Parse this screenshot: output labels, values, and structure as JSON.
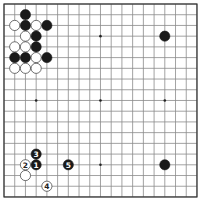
{
  "board": {
    "size": 19,
    "origin_x": 4,
    "origin_y": 4,
    "spacing": 10.72,
    "stone_radius": 5.1,
    "colors": {
      "black": "#1a1a1a",
      "white": "#ffffff",
      "grid": "#8a8a8a",
      "border": "#333333"
    },
    "hoshi": [
      [
        3,
        3
      ],
      [
        9,
        3
      ],
      [
        15,
        3
      ],
      [
        3,
        9
      ],
      [
        9,
        9
      ],
      [
        15,
        9
      ],
      [
        3,
        15
      ],
      [
        9,
        15
      ],
      [
        15,
        15
      ]
    ],
    "stones": [
      {
        "color": "black",
        "col": 2,
        "row": 1
      },
      {
        "color": "white",
        "col": 1,
        "row": 2
      },
      {
        "color": "black",
        "col": 2,
        "row": 2
      },
      {
        "color": "white",
        "col": 3,
        "row": 2
      },
      {
        "color": "black",
        "col": 4,
        "row": 2
      },
      {
        "color": "white",
        "col": 2,
        "row": 3
      },
      {
        "color": "black",
        "col": 3,
        "row": 3
      },
      {
        "color": "white",
        "col": 1,
        "row": 4
      },
      {
        "color": "white",
        "col": 2,
        "row": 4
      },
      {
        "color": "black",
        "col": 3,
        "row": 4
      },
      {
        "color": "black",
        "col": 1,
        "row": 5
      },
      {
        "color": "black",
        "col": 2,
        "row": 5
      },
      {
        "color": "white",
        "col": 3,
        "row": 5
      },
      {
        "color": "black",
        "col": 4,
        "row": 5
      },
      {
        "color": "white",
        "col": 1,
        "row": 6
      },
      {
        "color": "white",
        "col": 2,
        "row": 6
      },
      {
        "color": "white",
        "col": 3,
        "row": 6
      },
      {
        "color": "black",
        "col": 15,
        "row": 3
      },
      {
        "color": "black",
        "col": 15,
        "row": 15
      },
      {
        "color": "white",
        "col": 2,
        "row": 16
      },
      {
        "color": "black",
        "col": 3,
        "row": 15,
        "label": "1"
      },
      {
        "color": "white",
        "col": 2,
        "row": 15,
        "label": "2"
      },
      {
        "color": "black",
        "col": 3,
        "row": 14,
        "label": "3"
      },
      {
        "color": "white",
        "col": 4,
        "row": 17,
        "label": "4"
      },
      {
        "color": "black",
        "col": 6,
        "row": 15,
        "label": "5"
      }
    ]
  }
}
